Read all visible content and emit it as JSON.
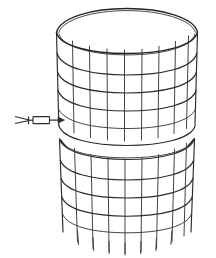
{
  "figure": {
    "title": "Two-tier cylindrical wire mesh cage",
    "style": {
      "background_color": "#ffffff",
      "line_color": "#2b2b2b",
      "rim_color": "#242424",
      "thin_line_color": "#3a3a3a",
      "line_width": 1.15
    },
    "parts": [
      {
        "id": "upper-section",
        "name": "upper cylinder section",
        "vertical_wire_count": 10,
        "horizontal_ring_count": 5,
        "has_top_rim": true
      },
      {
        "id": "gap",
        "name": "gap between sections",
        "height_px": 14
      },
      {
        "id": "lower-section",
        "name": "lower cylinder section",
        "vertical_wire_count": 10,
        "horizontal_ring_count": 5,
        "has_ground_legs": true,
        "leg_count": 8
      },
      {
        "id": "leader-arrow",
        "name": "leader line with arrowhead callout",
        "points_to": "upper cylinder lower edge",
        "orientation": "horizontal-left"
      }
    ],
    "geometry": {
      "canvas_width": 216,
      "canvas_height": 258,
      "cylinder_center_x": 127,
      "cylinder_half_width": 72,
      "ellipse_ry_top": 22,
      "ellipse_ry_mid": 17,
      "ellipse_ry_bottom": 20,
      "upper_top_y": 30,
      "upper_bottom_y": 125,
      "lower_top_y": 139,
      "lower_bottom_y": 232,
      "leg_bottom_y": 252
    },
    "labels": {
      "caption": ""
    }
  }
}
